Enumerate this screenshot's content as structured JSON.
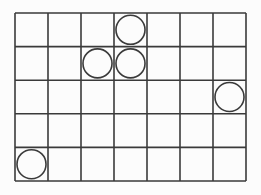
{
  "grid": {
    "columns": 7,
    "rows": 5,
    "origin_x": 15,
    "origin_y": 13,
    "width": 231,
    "height": 168,
    "line_color": "#3a3a3a",
    "line_width": 1.6,
    "background": "#fcfcfc"
  },
  "circles": [
    {
      "col": 3,
      "row": 0
    },
    {
      "col": 2,
      "row": 1
    },
    {
      "col": 3,
      "row": 1
    },
    {
      "col": 6,
      "row": 2
    },
    {
      "col": 0,
      "row": 4
    }
  ],
  "circle_style": {
    "stroke": "#3a3a3a",
    "stroke_width": 1.6,
    "fill": "none",
    "radius_ratio": 0.44
  }
}
